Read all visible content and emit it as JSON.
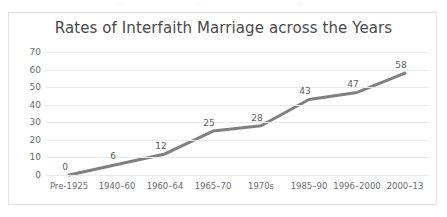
{
  "chart_data": {
    "type": "line",
    "title": "Rates of Interfaith Marriage across the Years",
    "xlabel": "",
    "ylabel": "",
    "categories": [
      "Pre-1925",
      "1940–60",
      "1960–64",
      "1965–70",
      "1970s",
      "1985–90",
      "1996–2000",
      "2000–13"
    ],
    "values": [
      0,
      6,
      12,
      25,
      28,
      43,
      47,
      58
    ],
    "data_labels": [
      "0",
      "6",
      "12",
      "25",
      "28",
      "43",
      "47",
      "58"
    ],
    "ylim": [
      0,
      70
    ],
    "ytick_step": 10,
    "ytick_labels": [
      "70",
      "60",
      "50",
      "40",
      "30",
      "20",
      "10",
      "0"
    ],
    "grid": true,
    "legend": false,
    "legend_position": "none",
    "series": [
      {
        "name": "Rate of Interfaith Marriage",
        "values": [
          0,
          6,
          12,
          25,
          28,
          43,
          47,
          58
        ]
      }
    ]
  },
  "colors": {
    "line": "#808080",
    "gridline": "#e9e9e9",
    "border": "#e2e2e2",
    "title_text": "#4a4a4a",
    "axis_text": "#6b6b6b",
    "label_text": "#5d5d5d",
    "background": "#ffffff"
  }
}
